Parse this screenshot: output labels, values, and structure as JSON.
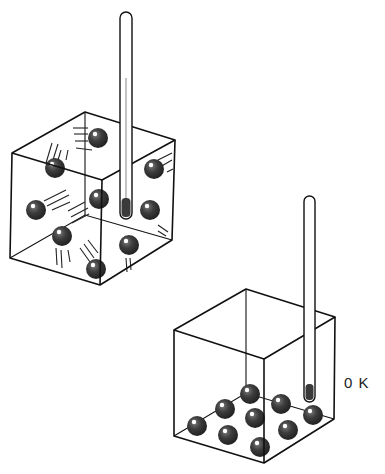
{
  "diagram": {
    "hot_box": {
      "particle_count": 9,
      "state": "moving",
      "thermometer": "thermometer-icon"
    },
    "cold_box": {
      "particle_count": 9,
      "state": "at-rest",
      "thermometer": "thermometer-icon",
      "temperature_label": "0 K"
    },
    "colors": {
      "line": "#111111",
      "particle": "#3a3a3a",
      "highlight": "#ffffff",
      "background": "#ffffff"
    }
  }
}
